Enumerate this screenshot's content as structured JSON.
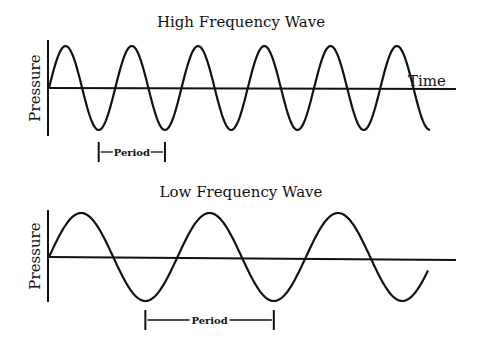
{
  "panels": [
    {
      "id": "high",
      "title": "High Frequency Wave",
      "y_label": "Pressure",
      "x_label": "Time",
      "cycles": 5.75,
      "period_label": "Period",
      "period_marker_start_cycle": 0.75,
      "period_marker_cycles": 1
    },
    {
      "id": "low",
      "title": "Low Frequency Wave",
      "y_label": "Pressure",
      "x_label": "",
      "cycles": 2.95,
      "period_label": "Period",
      "period_marker_start_cycle": 0.75,
      "period_marker_cycles": 1
    }
  ],
  "colors": {
    "ink": "#111111",
    "background": "#ffffff"
  }
}
